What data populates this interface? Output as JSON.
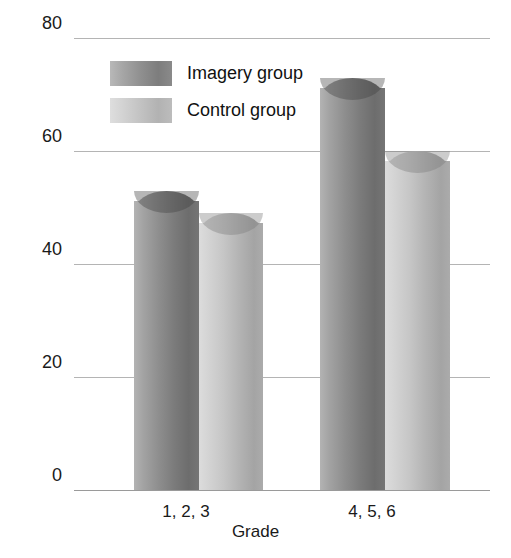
{
  "chart_data": {
    "type": "bar",
    "title": "",
    "xlabel": "Grade",
    "ylabel": "Mean percent of material remembered",
    "categories": [
      "1, 2, 3",
      "4, 5, 6"
    ],
    "series": [
      {
        "name": "Imagery group",
        "values": [
          53,
          73
        ],
        "color": "#8e8e8e"
      },
      {
        "name": "Control group",
        "values": [
          49,
          60
        ],
        "color": "#c4c4c4"
      }
    ],
    "ylim": [
      0,
      80
    ],
    "yticks": [
      0,
      20,
      40,
      60,
      80
    ],
    "ytick_labels": [
      "0",
      "20",
      "40",
      "60",
      "80"
    ],
    "grid": true,
    "legend_position": "upper-center"
  },
  "axes": {
    "y_title": "Mean percent of material remembered",
    "x_title": "Grade",
    "tick_80": "80",
    "tick_60": "60",
    "tick_40": "40",
    "tick_20": "20",
    "tick_0": "0"
  },
  "categories": {
    "cat0": "1, 2, 3",
    "cat1": "4, 5, 6"
  },
  "legend": {
    "items": [
      {
        "label": "Imagery group",
        "swatch": "dark-gray-cylinder"
      },
      {
        "label": "Control group",
        "swatch": "light-gray-cylinder"
      }
    ],
    "item0_label": "Imagery group",
    "item1_label": "Control group"
  },
  "colors": {
    "imagery_dark": "#6d6d6d",
    "imagery_light": "#b3b3b3",
    "control_dark": "#a4a4a4",
    "control_light": "#dcdcdc",
    "gridline": "#b4b4b4",
    "text": "#1a1a1a",
    "background": "#ffffff"
  }
}
